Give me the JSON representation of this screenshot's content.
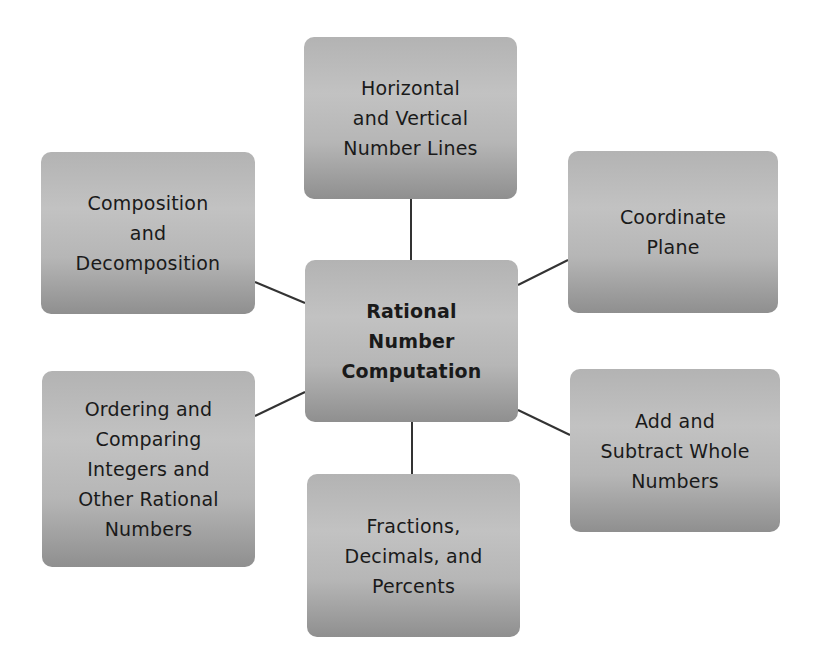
{
  "diagram": {
    "type": "hub-and-spoke concept map",
    "center": {
      "label": "Rational\nNumber\nComputation",
      "bold": true
    },
    "nodes": [
      {
        "id": "horizontal-vertical",
        "label": "Horizontal\nand Vertical\nNumber Lines",
        "position": "top"
      },
      {
        "id": "coordinate-plane",
        "label": "Coordinate\nPlane",
        "position": "top-right"
      },
      {
        "id": "add-subtract",
        "label": "Add and\nSubtract Whole\nNumbers",
        "position": "bottom-right"
      },
      {
        "id": "fractions",
        "label": "Fractions,\nDecimals, and\nPercents",
        "position": "bottom"
      },
      {
        "id": "ordering",
        "label": "Ordering and\nComparing\nIntegers and\nOther Rational\nNumbers",
        "position": "bottom-left"
      },
      {
        "id": "composition",
        "label": "Composition\nand\nDecomposition",
        "position": "top-left"
      }
    ],
    "colors": {
      "box_top": "#b3b3b3",
      "box_mid": "#c2c2c2",
      "box_bottom": "#8f8f8f",
      "text": "#1a1a1a",
      "connector": "#333333",
      "background": "#ffffff"
    }
  }
}
